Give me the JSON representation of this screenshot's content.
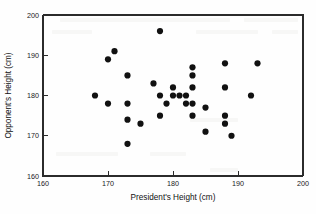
{
  "chart_data": {
    "type": "scatter",
    "title": "",
    "xlabel": "President's Height (cm)",
    "ylabel": "Opponent's Height (cm)",
    "xlim": [
      160,
      200
    ],
    "ylim": [
      160,
      200
    ],
    "xticks": [
      160,
      170,
      180,
      190,
      200
    ],
    "yticks": [
      160,
      170,
      180,
      190,
      200
    ],
    "xtick_labels": [
      "160",
      "170",
      "180",
      "190",
      "200"
    ],
    "ytick_labels": [
      "160",
      "170",
      "180",
      "190",
      "200"
    ],
    "grid": false,
    "legend": null,
    "marker": "filled-circle",
    "marker_color": "#111111",
    "marker_size_px": 3.1,
    "series": [
      {
        "name": "President vs Opponent height",
        "points": [
          [
            168,
            180
          ],
          [
            170,
            189
          ],
          [
            170,
            178
          ],
          [
            171,
            191
          ],
          [
            173,
            185
          ],
          [
            173,
            178
          ],
          [
            173,
            174
          ],
          [
            173,
            168
          ],
          [
            175,
            173
          ],
          [
            177,
            183
          ],
          [
            178,
            196
          ],
          [
            178,
            180
          ],
          [
            178,
            175
          ],
          [
            179,
            178
          ],
          [
            180,
            182
          ],
          [
            180,
            180
          ],
          [
            181,
            180
          ],
          [
            182,
            180
          ],
          [
            182,
            178
          ],
          [
            183,
            187
          ],
          [
            183,
            185
          ],
          [
            183,
            182
          ],
          [
            183,
            178
          ],
          [
            183,
            175
          ],
          [
            185,
            177
          ],
          [
            185,
            171
          ],
          [
            188,
            188
          ],
          [
            188,
            182
          ],
          [
            188,
            175
          ],
          [
            188,
            173
          ],
          [
            189,
            170
          ],
          [
            192,
            180
          ],
          [
            193,
            188
          ]
        ]
      }
    ]
  },
  "axes": {
    "x_title": "President's Height (cm)",
    "y_title": "Opponent's Height (cm)"
  }
}
